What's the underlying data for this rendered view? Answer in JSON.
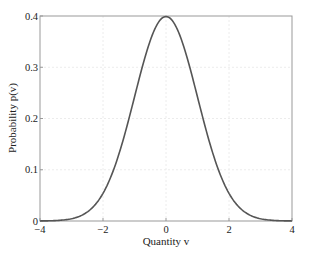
{
  "chart_data": {
    "type": "line",
    "title": "",
    "xlabel": "Quantity v",
    "ylabel": "Probability p(v)",
    "xlim": [
      -4,
      4
    ],
    "ylim": [
      0,
      0.4
    ],
    "xticks": [
      "−4",
      "−2",
      "0",
      "2",
      "4"
    ],
    "yticks": [
      "0",
      "0.1",
      "0.2",
      "0.3",
      "0.4"
    ],
    "grid": true,
    "legend": null,
    "series": [
      {
        "name": "Standard normal PDF",
        "color": "#555555",
        "x": [
          -4,
          -3.5,
          -3,
          -2.5,
          -2,
          -1.5,
          -1,
          -0.5,
          0,
          0.5,
          1,
          1.5,
          2,
          2.5,
          3,
          3.5,
          4
        ],
        "y": [
          0.0001,
          0.0009,
          0.0044,
          0.0175,
          0.054,
          0.1295,
          0.242,
          0.3521,
          0.3989,
          0.3521,
          0.242,
          0.1295,
          0.054,
          0.0175,
          0.0044,
          0.0009,
          0.0001
        ]
      }
    ]
  }
}
